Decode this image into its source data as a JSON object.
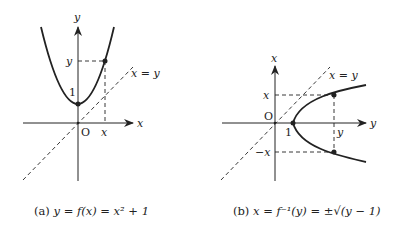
{
  "panel_a": {
    "axis_x_label": "x",
    "axis_y_label": "y",
    "origin_label": "O",
    "tick_one_label": "1",
    "point_x_label": "x",
    "point_y_label": "y",
    "diagonal_label": "x = y",
    "caption_prefix": "(a)",
    "caption": "y = f(x) = x² + 1"
  },
  "panel_b": {
    "axis_x_label": "y",
    "axis_y_label": "x",
    "origin_label": "O",
    "tick_one_label": "1",
    "point_pos_label": "x",
    "point_neg_label": "−x",
    "point_y_label": "y",
    "diagonal_label": "x = y",
    "caption_prefix": "(b)",
    "caption": "x = f⁻¹(y) = ±√(y − 1)"
  },
  "colors": {
    "ink": "#222222",
    "background": "#ffffff"
  }
}
